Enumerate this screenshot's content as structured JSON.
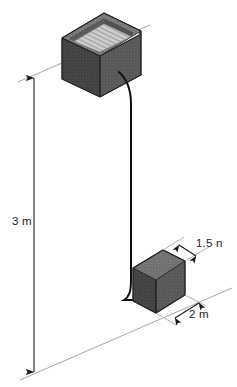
{
  "diagram": {
    "background_color": "#ffffff",
    "line_color": "#9a9a9a",
    "dim_line_color": "#3a3a3a",
    "cable_color": "#111111",
    "labels": {
      "height": "3 m",
      "depth": "1.5 n",
      "width": "2 m"
    },
    "objects": {
      "upper_crate": {
        "name": "open-crate",
        "top_face_color": "#8e8e8e",
        "inner_floor_color": "#c9c9c9",
        "left_face_color": "#4a4a4a",
        "front_face_color": "#3f3f3f",
        "rim_color": "#6d6d6d",
        "edge_color": "#2b2b2b"
      },
      "lower_block": {
        "name": "solid-block",
        "top_face_color": "#6e6e6e",
        "left_face_color": "#4a4a4a",
        "front_face_color": "#5a5a5a",
        "edge_color": "#2b2b2b"
      },
      "cable": {
        "name": "suspension-cable",
        "stroke_width": "2"
      }
    }
  }
}
